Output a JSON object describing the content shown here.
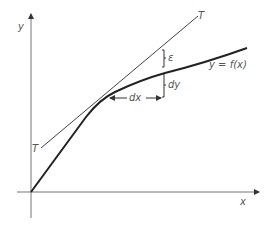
{
  "figure": {
    "axes": {
      "x_label": "x",
      "y_label": "y"
    },
    "tangent_label_top": "T",
    "tangent_label_bottom": "T",
    "curve_label": "y = f(x)",
    "epsilon_label": "ε",
    "dy_label": "dy",
    "dx_label": "dx"
  },
  "colors": {
    "axis": "#777777",
    "curve": "#222222",
    "tangent": "#444444",
    "text": "#555555"
  }
}
